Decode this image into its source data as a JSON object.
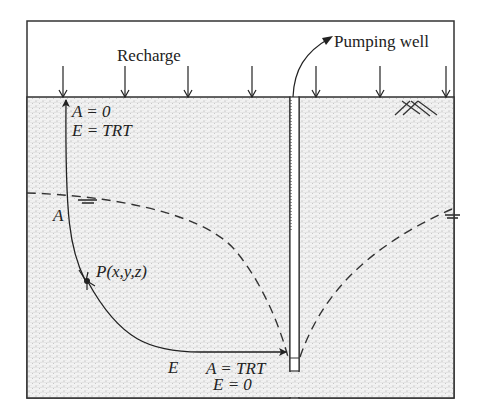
{
  "diagram": {
    "labels": {
      "recharge": "Recharge",
      "pumping_well": "Pumping well",
      "top_A": "A = 0",
      "top_E": "E = TRT",
      "side_A": "A",
      "point_P": "P(x,y,z)",
      "bottom_E": "E",
      "bottom_A": "A = TRT",
      "bottom_E0": "E = 0"
    },
    "colors": {
      "line": "#222222",
      "aquifer_fill": "#efefef",
      "stipple": "#8a8a8a",
      "background": "#ffffff"
    }
  }
}
